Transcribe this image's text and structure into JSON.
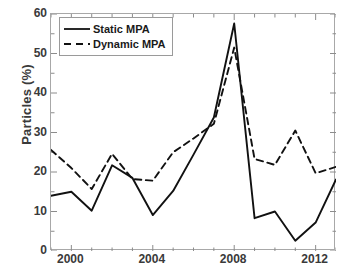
{
  "chart_data": {
    "type": "line",
    "title": "",
    "xlabel": "",
    "ylabel": "Particles (%)",
    "xlim": [
      1999,
      2013
    ],
    "ylim": [
      0,
      60
    ],
    "xticks": [
      2000,
      2004,
      2008,
      2012
    ],
    "yticks": [
      0,
      10,
      20,
      30,
      40,
      50,
      60
    ],
    "minor_xticks_interval": 1,
    "grid": false,
    "legend_position": "upper-left",
    "x": [
      1999,
      2000,
      2001,
      2002,
      2003,
      2004,
      2005,
      2006,
      2007,
      2008,
      2009,
      2010,
      2011,
      2012,
      2013
    ],
    "series": [
      {
        "name": "Static MPA",
        "style": "solid",
        "color": "#111111",
        "values": [
          14.0,
          15.0,
          10.2,
          21.7,
          18.5,
          9.1,
          15.2,
          24.4,
          33.8,
          57.6,
          8.3,
          10.0,
          2.6,
          7.2,
          18.1
        ]
      },
      {
        "name": "Dynamic MPA",
        "style": "dashed",
        "color": "#111111",
        "values": [
          25.6,
          21.0,
          15.7,
          24.6,
          18.2,
          17.8,
          25.0,
          28.5,
          32.2,
          51.5,
          23.3,
          21.8,
          30.5,
          19.7,
          21.3
        ]
      }
    ]
  },
  "legend": {
    "items": [
      {
        "label": "Static MPA",
        "style": "solid"
      },
      {
        "label": "Dynamic MPA",
        "style": "dashed"
      }
    ]
  },
  "axes": {
    "ylabel": "Particles (%)",
    "ytick_labels": [
      "0",
      "10",
      "20",
      "30",
      "40",
      "50",
      "60"
    ],
    "xtick_labels": [
      "2000",
      "2004",
      "2008",
      "2012"
    ]
  }
}
